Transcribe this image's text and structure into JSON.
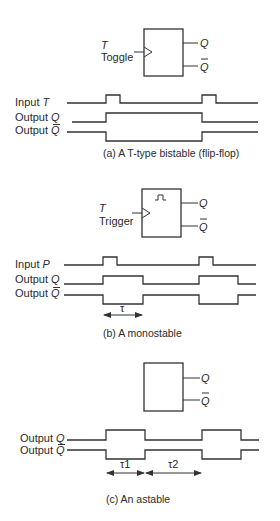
{
  "panels": {
    "a": {
      "caption": "(a)  A T-type bistable (flip-flop)",
      "block": {
        "input_symbol": "T",
        "input_name": "Toggle",
        "output_q": "Q",
        "output_qbar": "Q",
        "clock_input": true,
        "pulse_glyph": false
      },
      "signals": [
        {
          "label_prefix": "Input ",
          "label_symbol": "T",
          "overbar": false
        },
        {
          "label_prefix": "Output ",
          "label_symbol": "Q",
          "overbar": false
        },
        {
          "label_prefix": "Output ",
          "label_symbol": "Q",
          "overbar": true
        }
      ]
    },
    "b": {
      "caption": "(b) A monostable",
      "block": {
        "input_symbol": "T",
        "input_name": "Trigger",
        "output_q": "Q",
        "output_qbar": "Q",
        "clock_input": true,
        "pulse_glyph": true
      },
      "signals": [
        {
          "label_prefix": "Input ",
          "label_symbol": "P",
          "overbar": false
        },
        {
          "label_prefix": "Output ",
          "label_symbol": "Q",
          "overbar": false
        },
        {
          "label_prefix": "Output ",
          "label_symbol": "Q",
          "overbar": true
        }
      ],
      "timing": [
        {
          "label": "τ"
        }
      ]
    },
    "c": {
      "caption": "(c) An astable",
      "block": {
        "output_q": "Q",
        "output_qbar": "Q",
        "clock_input": false,
        "pulse_glyph": false
      },
      "signals": [
        {
          "label_prefix": "Output ",
          "label_symbol": "Q",
          "overbar": false
        },
        {
          "label_prefix": "Output ",
          "label_symbol": "Q",
          "overbar": true
        }
      ],
      "timing": [
        {
          "label": "τ1"
        },
        {
          "label": "τ2"
        }
      ]
    }
  }
}
